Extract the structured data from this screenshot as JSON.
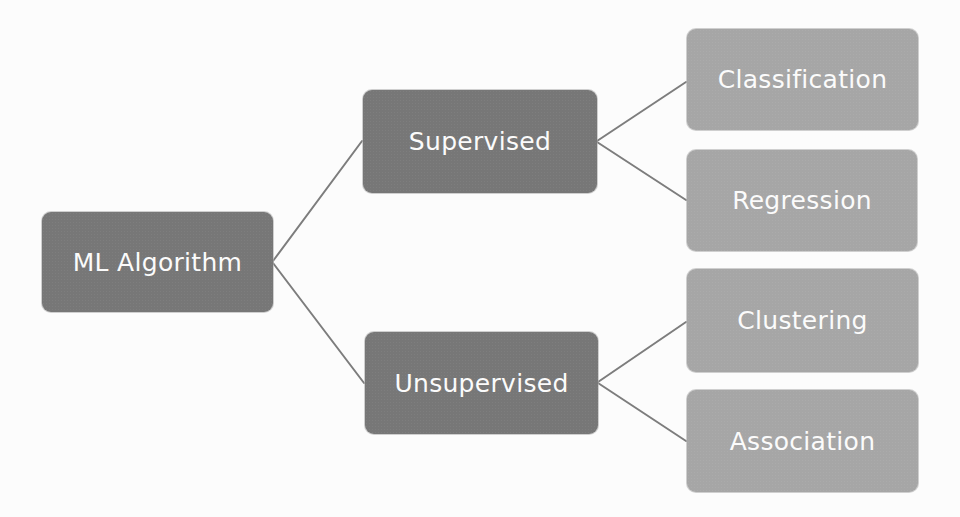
{
  "diagram": {
    "type": "hierarchy-tree",
    "colors": {
      "background": "#fcfcfc",
      "level_dark": "#777777",
      "level_light": "#a6a6a6",
      "connector": "#7d7d7d",
      "node_text": "#fbfbfb"
    },
    "root": {
      "label": "ML Algorithm"
    },
    "branches": [
      {
        "label": "Supervised",
        "children": [
          {
            "label": "Classification"
          },
          {
            "label": "Regression"
          }
        ]
      },
      {
        "label": "Unsupervised",
        "children": [
          {
            "label": "Clustering"
          },
          {
            "label": "Association"
          }
        ]
      }
    ],
    "edges": [
      [
        "ML Algorithm",
        "Supervised"
      ],
      [
        "ML Algorithm",
        "Unsupervised"
      ],
      [
        "Supervised",
        "Classification"
      ],
      [
        "Supervised",
        "Regression"
      ],
      [
        "Unsupervised",
        "Clustering"
      ],
      [
        "Unsupervised",
        "Association"
      ]
    ]
  }
}
